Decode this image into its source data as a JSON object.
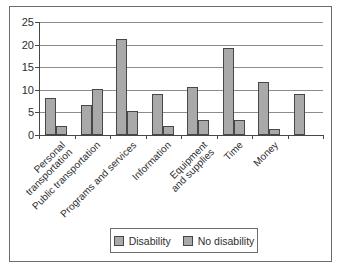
{
  "chart_data": {
    "type": "bar",
    "categories": [
      "Personal\ntransportation",
      "Public transportation",
      "Programs and services",
      "Information",
      "Equipment\nand supplies",
      "Time",
      "Money",
      ""
    ],
    "series": [
      {
        "name": "Disability",
        "values": [
          8.3,
          6.6,
          21.4,
          9.1,
          10.7,
          19.3,
          11.8,
          9.1
        ]
      },
      {
        "name": "No disability",
        "values": [
          2.1,
          10.3,
          5.4,
          2.1,
          3.4,
          3.3,
          1.3,
          null
        ]
      }
    ],
    "title": "",
    "xlabel": "",
    "ylabel": "",
    "ylim": [
      0,
      25
    ],
    "yticks": [
      0,
      5,
      10,
      15,
      20,
      25
    ],
    "grid": true,
    "legend_position": "bottom",
    "colors": {
      "bar_fill": "#a9a9a9",
      "bar_border": "#474747",
      "gridline": "#8c8c8c",
      "axis": "#474747",
      "text": "#2e2e2e",
      "figure_border": "#6b6b6b",
      "background": "#ffffff"
    }
  }
}
